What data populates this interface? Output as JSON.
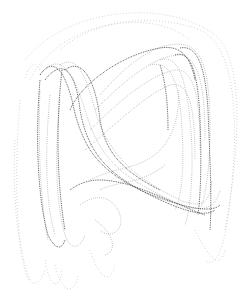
{
  "image": {
    "description": "Dotted strange-attractor style line drawing on white background",
    "background_color": "#ffffff",
    "stroke_colors": {
      "faint": "#bdbdbd",
      "mid": "#8a8a8a",
      "dark": "#4a4a4a"
    }
  }
}
